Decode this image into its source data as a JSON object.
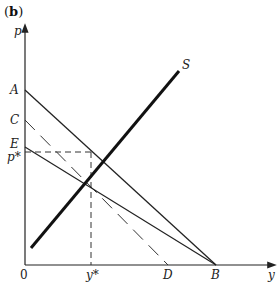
{
  "figure": {
    "panel_label_open": "(",
    "panel_label_letter": "b",
    "panel_label_close": ")",
    "axes": {
      "y_label": "p",
      "x_label": "y",
      "origin_label": "0"
    },
    "intercept_labels": {
      "A": "A",
      "C": "C",
      "E": "E",
      "p_star": "p*",
      "y_star": "y*",
      "D": "D",
      "B": "B",
      "S": "S"
    },
    "lines": [
      {
        "name": "AB",
        "from": "A",
        "to": "B",
        "style": "solid"
      },
      {
        "name": "CD",
        "from": "C",
        "to": "D",
        "style": "dashed"
      },
      {
        "name": "EB",
        "from": "E",
        "to": "B",
        "style": "solid"
      },
      {
        "name": "S",
        "style": "solid-bold",
        "description": "supply curve"
      },
      {
        "name": "p-star-guide",
        "style": "dashed",
        "description": "horizontal from p* to equilibrium"
      },
      {
        "name": "y-star-guide",
        "style": "dashed",
        "description": "vertical from y* to equilibrium"
      }
    ],
    "colors": {
      "ink": "#222222",
      "background": "#ffffff"
    }
  }
}
